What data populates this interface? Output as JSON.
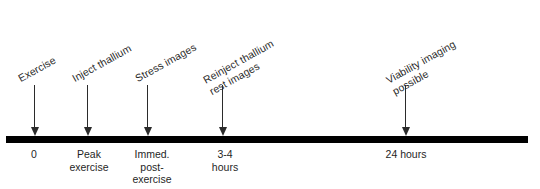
{
  "diagram": {
    "type": "timeline",
    "axis": {
      "color": "#000000",
      "start_px": 6,
      "end_px": 528
    },
    "events": [
      {
        "id": "exercise",
        "top_label_line1": "Exercise",
        "top_label_line2": "",
        "bottom_label_line1": "0",
        "bottom_label_line2": "",
        "bottom_label_line3": "",
        "x": 34
      },
      {
        "id": "inject-thallium",
        "top_label_line1": "Inject  thallium",
        "top_label_line2": "",
        "bottom_label_line1": "Peak",
        "bottom_label_line2": "exercise",
        "bottom_label_line3": "",
        "x": 87
      },
      {
        "id": "stress-images",
        "top_label_line1": "Stress images",
        "top_label_line2": "",
        "bottom_label_line1": "Immed.",
        "bottom_label_line2": "post-",
        "bottom_label_line3": "exercise",
        "x": 147
      },
      {
        "id": "reinject-thallium",
        "top_label_line1": "Reinject thallium",
        "top_label_line2": "rest images",
        "bottom_label_line1": "3-4",
        "bottom_label_line2": "hours",
        "bottom_label_line3": "",
        "x": 222
      },
      {
        "id": "viability-imaging",
        "top_label_line1": "Viability imaging",
        "top_label_line2": "possible",
        "bottom_label_line1": "24 hours",
        "bottom_label_line2": "",
        "bottom_label_line3": "",
        "x": 405
      }
    ]
  }
}
